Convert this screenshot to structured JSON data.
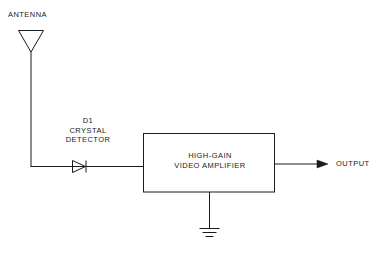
{
  "diagram": {
    "background_color": "#ffffff",
    "line_color": "#1a1a1a",
    "text_color": "#1a1a1a",
    "antenna": {
      "label": "ANTENNA",
      "icon": "antenna-dipole-icon"
    },
    "detector": {
      "reference": "D1",
      "name_line1": "CRYSTAL",
      "name_line2": "DETECTOR",
      "label": "D1\nCRYSTAL\nDETECTOR",
      "icon": "diode-icon"
    },
    "amplifier": {
      "line1": "HIGH-GAIN",
      "line2": "VIDEO AMPLIFIER",
      "label": "HIGH-GAIN\nVIDEO AMPLIFIER"
    },
    "ground": {
      "icon": "ground-earth-icon"
    },
    "output": {
      "label": "OUTPUT",
      "icon": "arrow-right-icon"
    }
  }
}
